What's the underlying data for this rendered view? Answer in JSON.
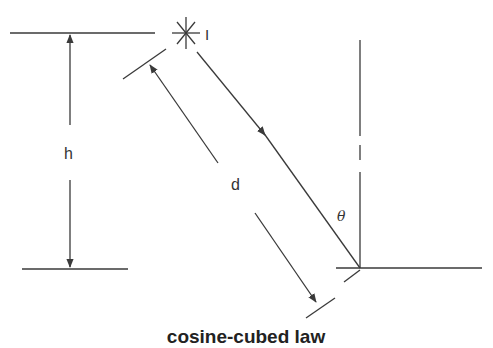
{
  "title": "cosine-cubed law",
  "labels": {
    "source": "I",
    "height": "h",
    "distance": "d",
    "angle": "θ"
  },
  "icons": {
    "light_source": "star-burst-icon"
  },
  "colors": {
    "line": "#3a3a3a",
    "background": "#ffffff"
  }
}
